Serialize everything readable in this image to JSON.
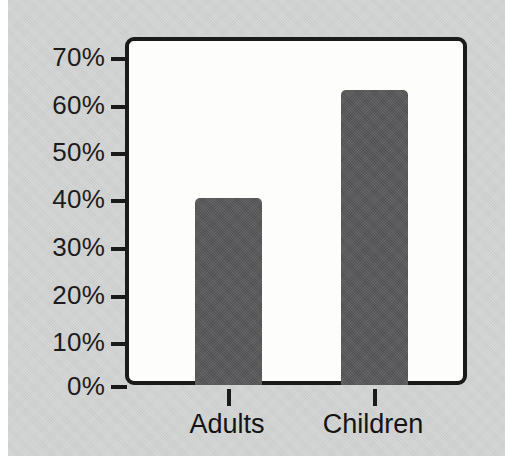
{
  "chart_data": {
    "type": "bar",
    "title": "",
    "subtitle": "",
    "xlabel": "",
    "ylabel": "",
    "categories": [
      "Adults",
      "Children"
    ],
    "values": [
      40,
      63
    ],
    "value_labels": [
      "40%",
      "63%"
    ],
    "ylim": [
      0,
      70
    ],
    "yticks": [
      0,
      10,
      20,
      30,
      40,
      50,
      60,
      70
    ],
    "ytick_labels": [
      "0%",
      "10%",
      "20%",
      "30%",
      "40%",
      "50%",
      "60%",
      "70%"
    ],
    "grid": false,
    "legend": "none",
    "annotations": [],
    "colors": {
      "bar": "#58585a",
      "panel_background": "#cfd0d0",
      "plot_background": "#fdfdfc",
      "axis": "#1a1a1a",
      "text": "#1c1c1c",
      "page_background": "#ffffff"
    }
  }
}
